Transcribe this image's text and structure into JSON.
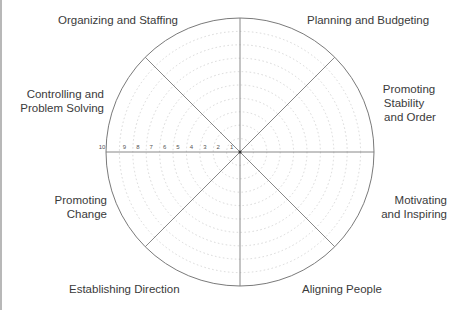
{
  "diagram": {
    "type": "wheel",
    "segments": 8,
    "scale_ticks": [
      "10",
      "9",
      "8",
      "7",
      "6",
      "5",
      "4",
      "3",
      "2",
      "1"
    ],
    "colors": {
      "outline": "#7a7a7a",
      "grid": "#d8d8d8",
      "text": "#3a3a3a"
    },
    "labels": {
      "organizing": "Organizing and Staffing",
      "planning": "Planning and Budgeting",
      "stability_1": "Promoting",
      "stability_2": "Stability",
      "stability_3": "and Order",
      "controlling_1": "Controlling and",
      "controlling_2": "Problem Solving",
      "change_1": "Promoting",
      "change_2": "Change",
      "motivating_1": "Motivating",
      "motivating_2": "and Inspiring",
      "direction": "Establishing Direction",
      "aligning": "Aligning People"
    }
  }
}
